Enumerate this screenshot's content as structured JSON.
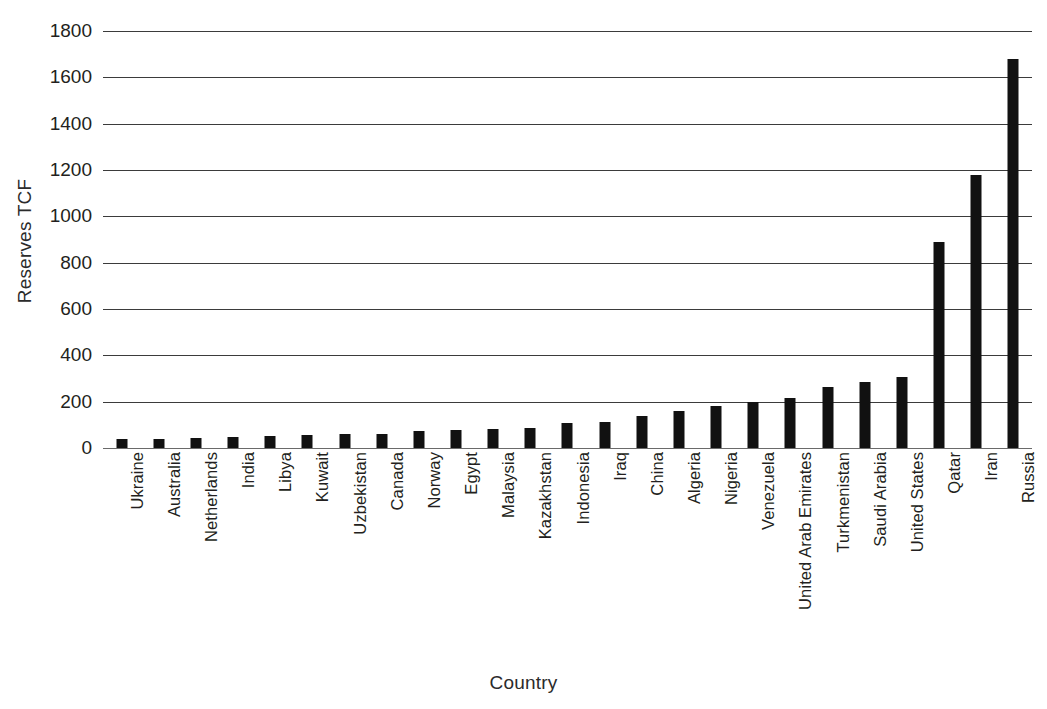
{
  "chart_data": {
    "type": "bar",
    "title": "",
    "xlabel": "Country",
    "ylabel": "Reserves TCF",
    "ylim": [
      0,
      1800
    ],
    "ytick_step": 200,
    "yticks": [
      0,
      200,
      400,
      600,
      800,
      1000,
      1200,
      1400,
      1600,
      1800
    ],
    "ytick_labels": [
      "0",
      "200",
      "400",
      "600",
      "800",
      "1000",
      "1200",
      "1400",
      "1600",
      "1800"
    ],
    "grid": true,
    "legend": false,
    "bar_color": "#111111",
    "categories": [
      "Ukraine",
      "Australia",
      "Netherlands",
      "India",
      "Libya",
      "Kuwait",
      "Uzbekistan",
      "Canada",
      "Norway",
      "Egypt",
      "Malaysia",
      "Kazakhstan",
      "Indonesia",
      "Iraq",
      "China",
      "Algeria",
      "Nigeria",
      "Venezuela",
      "United Arab Emirates",
      "Turkmenistan",
      "Saudi Arabia",
      "United States",
      "Qatar",
      "Iran",
      "Russia"
    ],
    "values": [
      39,
      40,
      43,
      47,
      53,
      56,
      59,
      62,
      72,
      77,
      83,
      85,
      106,
      112,
      137,
      159,
      182,
      198,
      215,
      265,
      283,
      305,
      890,
      1180,
      1680
    ]
  }
}
